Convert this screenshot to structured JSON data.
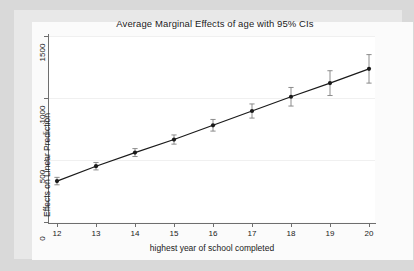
{
  "chart_data": {
    "type": "line",
    "title": "Average Marginal Effects of age with 95% CIs",
    "xlabel": "highest year of school completed",
    "ylabel": "Effects on Linear Prediction",
    "grid": true,
    "legend": null,
    "xlim": [
      11.6,
      20.4
    ],
    "ylim": [
      0,
      1500
    ],
    "xticks": [
      12,
      13,
      14,
      15,
      16,
      17,
      18,
      19,
      20
    ],
    "xtick_labels": [
      "12",
      "13",
      "14",
      "15",
      "16",
      "17",
      "18",
      "19",
      "20"
    ],
    "yticks": [
      0,
      500,
      1000,
      1500
    ],
    "ytick_labels": [
      "0",
      "500",
      "1000",
      "1500"
    ],
    "x": [
      12,
      13,
      14,
      15,
      16,
      17,
      18,
      19,
      20
    ],
    "values": [
      330,
      450,
      560,
      665,
      780,
      895,
      1010,
      1120,
      1235
    ],
    "ci_lower": [
      300,
      420,
      528,
      628,
      733,
      838,
      935,
      1020,
      1120
    ],
    "ci_upper": [
      360,
      480,
      592,
      702,
      827,
      952,
      1085,
      1220,
      1350
    ],
    "marker": "filled-circle",
    "marker_color": "#1a1a1a",
    "line_color": "#1a1a1a",
    "errorbar_color": "#808080",
    "series": [
      {
        "name": "Average marginal effect of age",
        "values": [
          330,
          450,
          560,
          665,
          780,
          895,
          1010,
          1120,
          1235
        ]
      }
    ]
  },
  "colors": {
    "figure_background": "#d9d9d9",
    "graph_background": "#e8e8e8",
    "plot_background": "#ffffff",
    "axis": "#6e6e6e",
    "gridline": "#f0f0f0",
    "text": "#1a1a1a"
  }
}
